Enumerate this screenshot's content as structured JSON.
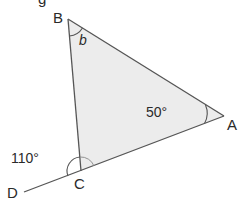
{
  "diagram": {
    "type": "triangle-with-exterior-angle",
    "vertices": {
      "A": {
        "label": "A",
        "x": 224,
        "y": 116
      },
      "B": {
        "label": "B",
        "x": 68,
        "y": 19
      },
      "C": {
        "label": "C",
        "x": 81,
        "y": 171
      },
      "D": {
        "label": "D",
        "x": 24,
        "y": 192
      }
    },
    "angles": {
      "A": "50°",
      "B": "b",
      "exterior_BCD": "110°"
    },
    "colors": {
      "line": "#555555",
      "fill": "#ececec",
      "text": "#2a2a2a"
    },
    "cropped_text_top": "g"
  }
}
